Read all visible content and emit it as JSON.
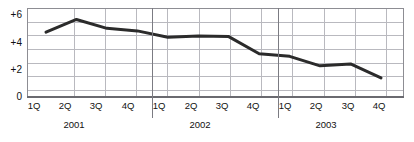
{
  "chart_data": {
    "type": "line",
    "title": "",
    "subtitle": "",
    "xlabel": "",
    "ylabel": "",
    "ylim": [
      0,
      7
    ],
    "y_ticks": [
      "0",
      "+2",
      "+4",
      "+6"
    ],
    "y_tick_values": [
      0,
      2,
      4,
      6
    ],
    "gridlines": {
      "horizontal": true,
      "vertical": true,
      "interval": 1
    },
    "legend": "none",
    "categories": [
      "1Q",
      "2Q",
      "3Q",
      "4Q",
      "1Q",
      "2Q",
      "3Q",
      "4Q",
      "1Q",
      "2Q",
      "3Q",
      "4Q"
    ],
    "groups": [
      {
        "label": "2001",
        "categories": [
          "1Q",
          "2Q",
          "3Q",
          "4Q"
        ]
      },
      {
        "label": "2002",
        "categories": [
          "1Q",
          "2Q",
          "3Q",
          "4Q"
        ]
      },
      {
        "label": "2003",
        "categories": [
          "1Q",
          "2Q",
          "3Q",
          "4Q"
        ]
      }
    ],
    "series": [
      {
        "name": "",
        "color": "#2b2b2b",
        "values": [
          5.1,
          6.1,
          5.4,
          5.2,
          4.7,
          4.8,
          4.75,
          3.4,
          3.2,
          2.45,
          2.6,
          1.5
        ]
      }
    ]
  },
  "axis": {
    "y_tick_0": "0",
    "y_tick_2": "+2",
    "y_tick_4": "+4",
    "y_tick_6": "+6"
  },
  "xticks": {
    "q1_2001": "1Q",
    "q2_2001": "2Q",
    "q3_2001": "3Q",
    "q4_2001": "4Q",
    "q1_2002": "1Q",
    "q2_2002": "2Q",
    "q3_2002": "3Q",
    "q4_2002": "4Q",
    "q1_2003": "1Q",
    "q2_2003": "2Q",
    "q3_2003": "3Q",
    "q4_2003": "4Q"
  },
  "years": {
    "y2001": "2001",
    "y2002": "2002",
    "y2003": "2003"
  },
  "colors": {
    "line": "#2b2b2b",
    "grid": "#b9b9bf",
    "frame": "#8d8d93",
    "axis": "#6a6a70",
    "text": "#111111",
    "background": "#ffffff"
  }
}
